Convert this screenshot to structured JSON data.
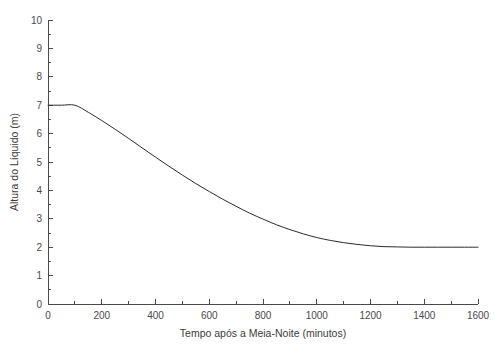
{
  "chart_data": {
    "type": "line",
    "title": "",
    "xlabel": "Tempo após a Meia-Noite (minutos)",
    "ylabel": "Altura do Líquido (m)",
    "xlim": [
      0,
      1600
    ],
    "ylim": [
      0,
      10
    ],
    "grid": false,
    "legend": false,
    "x_ticks": [
      0,
      200,
      400,
      600,
      800,
      1000,
      1200,
      1400,
      1600
    ],
    "x_tick_labels": [
      "0",
      "200",
      "400",
      "600",
      "800",
      "1000",
      "1200",
      "1400",
      "1600"
    ],
    "x_minor_tick_step": 100,
    "y_ticks": [
      0,
      1,
      2,
      3,
      4,
      5,
      6,
      7,
      8,
      9,
      10
    ],
    "y_tick_labels": [
      "0",
      "1",
      "2",
      "3",
      "4",
      "5",
      "6",
      "7",
      "8",
      "9",
      "10"
    ],
    "y_minor_tick_step": 0.5,
    "series": [
      {
        "name": "Altura do Líquido",
        "color": "#2b2b2b",
        "x": [
          0,
          50,
          100,
          150,
          200,
          250,
          300,
          350,
          400,
          450,
          500,
          550,
          600,
          650,
          700,
          750,
          800,
          850,
          900,
          950,
          1000,
          1050,
          1100,
          1150,
          1200,
          1250,
          1300,
          1350,
          1400,
          1450,
          1500,
          1550,
          1600
        ],
        "y": [
          7.0,
          7.0,
          7.0,
          6.75,
          6.46,
          6.15,
          5.83,
          5.5,
          5.17,
          4.85,
          4.54,
          4.24,
          3.96,
          3.69,
          3.44,
          3.2,
          2.99,
          2.79,
          2.62,
          2.47,
          2.34,
          2.24,
          2.16,
          2.1,
          2.05,
          2.02,
          2.01,
          2.0,
          2.0,
          2.0,
          2.0,
          2.0,
          2.0
        ]
      }
    ],
    "annotations": {
      "initial_level": 7.0,
      "hold_until_minutes": 100,
      "asymptote_level": 2.0,
      "settles_near_minutes": 1200
    },
    "colors": {
      "curve": "#2b2b2b",
      "axis": "#4a4a4a",
      "text": "#3c3c3c",
      "background": "#ffffff"
    }
  }
}
